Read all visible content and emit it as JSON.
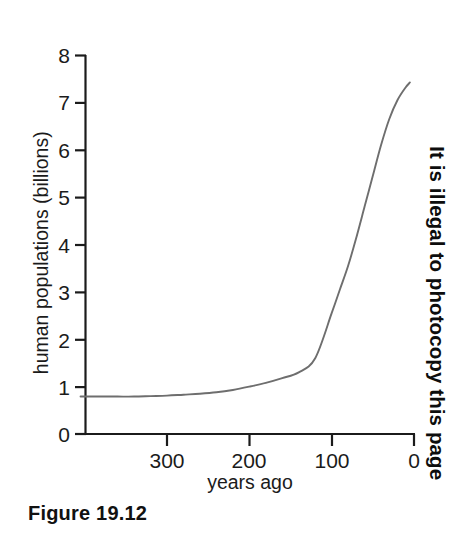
{
  "figure": {
    "caption": "Figure 19.12",
    "side_notice": "It is illegal to photocopy this page",
    "line_color": "#6e6e6e",
    "axis_color": "#1b1b1b",
    "background_color": "#ffffff"
  },
  "chart_data": {
    "type": "line",
    "title": "",
    "xlabel": "years ago",
    "ylabel": "human populations (billions)",
    "xlim": [
      405,
      0
    ],
    "ylim": [
      0,
      8
    ],
    "x_ticks": [
      300,
      200,
      100,
      0
    ],
    "x_tick_labels": [
      "300",
      "200",
      "100",
      "0"
    ],
    "y_ticks": [
      0,
      1,
      2,
      3,
      4,
      5,
      6,
      7,
      8
    ],
    "y_tick_labels": [
      "0",
      "1",
      "2",
      "3",
      "4",
      "5",
      "6",
      "7",
      "8"
    ],
    "x_axis_inverted": true,
    "grid": false,
    "legend": null,
    "series": [
      {
        "name": "human population",
        "color": "#6e6e6e",
        "x": [
          405,
          380,
          360,
          340,
          320,
          300,
          280,
          260,
          240,
          220,
          200,
          180,
          160,
          140,
          120,
          100,
          90,
          80,
          70,
          60,
          50,
          40,
          30,
          20,
          10,
          5
        ],
        "y": [
          0.79,
          0.79,
          0.79,
          0.79,
          0.8,
          0.81,
          0.83,
          0.85,
          0.88,
          0.93,
          1.0,
          1.08,
          1.18,
          1.3,
          1.6,
          2.55,
          3.05,
          3.55,
          4.15,
          4.8,
          5.45,
          6.1,
          6.65,
          7.05,
          7.32,
          7.42
        ]
      }
    ]
  },
  "axes": {
    "y_tick_values": [
      {
        "label": "8",
        "value": 8
      },
      {
        "label": "7",
        "value": 7
      },
      {
        "label": "6",
        "value": 6
      },
      {
        "label": "5",
        "value": 5
      },
      {
        "label": "4",
        "value": 4
      },
      {
        "label": "3",
        "value": 3
      },
      {
        "label": "2",
        "value": 2
      },
      {
        "label": "1",
        "value": 1
      },
      {
        "label": "0",
        "value": 0
      }
    ],
    "x_tick_values": [
      {
        "label": "300",
        "value": 300
      },
      {
        "label": "200",
        "value": 200
      },
      {
        "label": "100",
        "value": 100
      },
      {
        "label": "0",
        "value": 0
      }
    ]
  }
}
